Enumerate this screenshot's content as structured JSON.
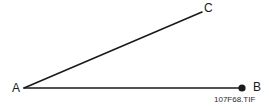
{
  "figure": {
    "name": "angle-diagram",
    "background_color": "#ffffff",
    "stroke_color": "#1a1a1a",
    "label_color": "#1a1a1a",
    "caption_color": "#2b2b2b",
    "width": 269,
    "height": 110
  },
  "diagram": {
    "type": "angle",
    "vertex_point": "A",
    "rays": [
      {
        "name": "ray-AB",
        "from": "A",
        "to": "B",
        "x1": 24,
        "y1": 88,
        "x2": 242,
        "y2": 88,
        "stroke_width": 1.6,
        "endpoint_marker": "filled-dot"
      },
      {
        "name": "ray-AC",
        "from": "A",
        "to": "C",
        "x1": 24,
        "y1": 88,
        "x2": 202,
        "y2": 12,
        "stroke_width": 1.6,
        "endpoint_marker": "none"
      }
    ],
    "endpoint_dot": {
      "at": "B",
      "cx": 242,
      "cy": 88,
      "r": 3.6,
      "fill": "#1a1a1a"
    },
    "labels": [
      {
        "id": "A",
        "text": "A",
        "x": 12,
        "y": 82
      },
      {
        "id": "B",
        "text": "B",
        "x": 253,
        "y": 81
      },
      {
        "id": "C",
        "text": "C",
        "x": 204,
        "y": 2
      }
    ]
  },
  "caption": {
    "text": "107F68.TIF"
  }
}
